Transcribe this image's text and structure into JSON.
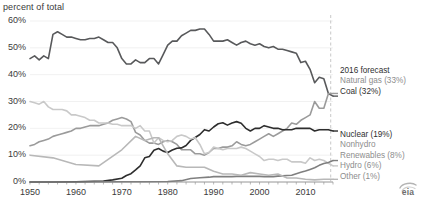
{
  "header": {
    "axis_note": "percent of total",
    "clipped_title": "U.S. electricity generation by source (1950-2016)"
  },
  "chart_data": {
    "type": "line",
    "title": "",
    "xlabel": "",
    "ylabel": "percent of total",
    "ylim": [
      0,
      60
    ],
    "xlim": [
      1950,
      2016
    ],
    "grid": true,
    "y_ticks": [
      "0%",
      "10%",
      "20%",
      "30%",
      "40%",
      "50%",
      "60%"
    ],
    "y_tick_values": [
      0,
      10,
      20,
      30,
      40,
      50,
      60
    ],
    "x_ticks": [
      "1950",
      "1960",
      "1970",
      "1980",
      "1990",
      "2000",
      "2010"
    ],
    "x_tick_values": [
      1950,
      1960,
      1970,
      1980,
      1990,
      2000,
      2010
    ],
    "legend_position": "right",
    "forecast_marker": {
      "label": "2016 forecast",
      "x": 2015.5,
      "style": "dashed-vertical"
    },
    "series": [
      {
        "name": "Coal",
        "legend": "Coal (32%)",
        "color": "#58595b",
        "final_value": 32,
        "x": [
          1950,
          1951,
          1952,
          1953,
          1954,
          1955,
          1956,
          1957,
          1958,
          1959,
          1960,
          1961,
          1962,
          1963,
          1964,
          1965,
          1966,
          1967,
          1968,
          1969,
          1970,
          1971,
          1972,
          1973,
          1974,
          1975,
          1976,
          1977,
          1978,
          1979,
          1980,
          1981,
          1982,
          1983,
          1984,
          1985,
          1986,
          1987,
          1988,
          1989,
          1990,
          1991,
          1992,
          1993,
          1994,
          1995,
          1996,
          1997,
          1998,
          1999,
          2000,
          2001,
          2002,
          2003,
          2004,
          2005,
          2006,
          2007,
          2008,
          2009,
          2010,
          2011,
          2012,
          2013,
          2014,
          2015,
          2016
        ],
        "values": [
          46,
          47,
          45.5,
          47,
          46,
          55,
          56,
          55,
          54,
          54,
          53.5,
          53,
          53,
          53.5,
          53.5,
          54,
          53,
          52,
          52,
          50,
          46,
          44,
          44,
          45.5,
          44.5,
          44.5,
          46,
          46,
          44,
          47.5,
          51,
          52.5,
          52.5,
          54.5,
          55.5,
          56.5,
          56.5,
          57,
          57,
          55,
          52.5,
          52.5,
          52.5,
          53,
          52,
          51,
          52,
          52.5,
          51.5,
          51,
          51.5,
          50.5,
          50,
          50.5,
          49.5,
          49.5,
          49,
          48.5,
          48,
          44.5,
          45,
          42,
          37,
          39,
          38.5,
          33,
          32
        ]
      },
      {
        "name": "Natural gas",
        "legend": "Natural gas (33%)",
        "color": "#9b9b9b",
        "final_value": 33,
        "x": [
          1950,
          1951,
          1952,
          1953,
          1954,
          1955,
          1956,
          1957,
          1958,
          1959,
          1960,
          1961,
          1962,
          1963,
          1964,
          1965,
          1966,
          1967,
          1968,
          1969,
          1970,
          1971,
          1972,
          1973,
          1974,
          1975,
          1976,
          1977,
          1978,
          1979,
          1980,
          1981,
          1982,
          1983,
          1984,
          1985,
          1986,
          1987,
          1988,
          1989,
          1990,
          1991,
          1992,
          1993,
          1994,
          1995,
          1996,
          1997,
          1998,
          1999,
          2000,
          2001,
          2002,
          2003,
          2004,
          2005,
          2006,
          2007,
          2008,
          2009,
          2010,
          2011,
          2012,
          2013,
          2014,
          2015,
          2016
        ],
        "values": [
          13.5,
          14,
          15,
          15.5,
          16,
          17,
          17.5,
          18,
          18.5,
          19,
          20,
          20,
          20.5,
          21,
          21,
          21,
          21.5,
          22,
          23,
          23.5,
          24,
          23.5,
          22.5,
          18.5,
          17.5,
          15.5,
          14.5,
          14.5,
          14,
          15,
          15.5,
          15,
          14,
          12,
          12,
          12,
          10.5,
          10.5,
          10,
          11,
          12.5,
          12.5,
          13,
          13,
          13.5,
          15,
          14,
          13.5,
          14,
          15,
          16,
          17,
          18,
          17,
          18,
          19,
          20,
          22,
          21.5,
          23,
          24,
          25,
          30,
          27.5,
          27.5,
          33,
          33
        ]
      },
      {
        "name": "Nuclear",
        "legend": "Nuclear (19%)",
        "color": "#2d2d2d",
        "final_value": 19,
        "x": [
          1950,
          1955,
          1960,
          1962,
          1964,
          1966,
          1968,
          1970,
          1971,
          1972,
          1973,
          1974,
          1975,
          1976,
          1977,
          1978,
          1979,
          1980,
          1981,
          1982,
          1983,
          1984,
          1985,
          1986,
          1987,
          1988,
          1989,
          1990,
          1991,
          1992,
          1993,
          1994,
          1995,
          1996,
          1997,
          1998,
          1999,
          2000,
          2001,
          2002,
          2003,
          2004,
          2005,
          2006,
          2007,
          2008,
          2009,
          2010,
          2011,
          2012,
          2013,
          2014,
          2015,
          2016
        ],
        "values": [
          0,
          0,
          0.1,
          0.2,
          0.3,
          0.4,
          0.8,
          1.4,
          2.4,
          3.1,
          4.5,
          6,
          9,
          9.5,
          11.8,
          12.5,
          11.5,
          11,
          11.9,
          12.6,
          12.7,
          13.6,
          15.5,
          16.6,
          17.7,
          19.5,
          19,
          20.5,
          21.7,
          22.1,
          21.2,
          22,
          22.5,
          21.9,
          20,
          19,
          20,
          20,
          21,
          20.5,
          20,
          20,
          19.5,
          19.5,
          19.5,
          20,
          20,
          20,
          20,
          19,
          19.5,
          19.5,
          19.5,
          19
        ]
      },
      {
        "name": "Hydro",
        "legend": "Hydro (6%)",
        "color": "#c9c9c9",
        "final_value": 6,
        "x": [
          1950,
          1951,
          1952,
          1953,
          1954,
          1955,
          1956,
          1957,
          1958,
          1959,
          1960,
          1961,
          1962,
          1963,
          1964,
          1965,
          1966,
          1967,
          1968,
          1969,
          1970,
          1971,
          1972,
          1973,
          1974,
          1975,
          1976,
          1977,
          1978,
          1979,
          1980,
          1981,
          1982,
          1983,
          1984,
          1985,
          1986,
          1987,
          1988,
          1989,
          1990,
          1991,
          1992,
          1993,
          1994,
          1995,
          1996,
          1997,
          1998,
          1999,
          2000,
          2001,
          2002,
          2003,
          2004,
          2005,
          2006,
          2007,
          2008,
          2009,
          2010,
          2011,
          2012,
          2013,
          2014,
          2015,
          2016
        ],
        "values": [
          30,
          29.5,
          29,
          30,
          28,
          27,
          27,
          27,
          26.5,
          25,
          25,
          24.5,
          24,
          23,
          23,
          22,
          22,
          22,
          21.5,
          21.5,
          21,
          21,
          21,
          20,
          21,
          19,
          19,
          14.5,
          16.5,
          15.5,
          15,
          15.5,
          17,
          17.5,
          17,
          16,
          16.5,
          14,
          10.5,
          11,
          13,
          12.5,
          12,
          12.5,
          12.5,
          12.5,
          13,
          12.5,
          11.5,
          10.5,
          9.5,
          8,
          8.5,
          8.5,
          8,
          8.5,
          8.5,
          7.5,
          7.5,
          7.5,
          7,
          9,
          8,
          8.5,
          8,
          7,
          6
        ]
      },
      {
        "name": "Nonhydro Renewables",
        "legend_line1": "Nonhydro",
        "legend_line2": "Renewables (8%)",
        "color": "#7f7f7f",
        "final_value": 8,
        "x": [
          1950,
          1960,
          1970,
          1975,
          1980,
          1983,
          1985,
          1987,
          1989,
          1990,
          1991,
          1992,
          1993,
          1994,
          1995,
          1996,
          1997,
          1998,
          1999,
          2000,
          2001,
          2002,
          2003,
          2004,
          2005,
          2006,
          2007,
          2008,
          2009,
          2010,
          2011,
          2012,
          2013,
          2014,
          2015,
          2016
        ],
        "values": [
          0,
          0,
          0.1,
          0.1,
          0.2,
          0.5,
          1.3,
          1.6,
          1.8,
          2,
          2,
          2,
          2,
          2,
          2.1,
          2.1,
          2.1,
          2.1,
          2.1,
          2.1,
          2,
          2,
          2,
          2.2,
          2.3,
          2.4,
          2.5,
          3.1,
          3.6,
          4.1,
          4.7,
          5.3,
          6.2,
          6.9,
          7.3,
          8
        ]
      },
      {
        "name": "Other",
        "legend": "Other (1%)",
        "color": "#b8b8b8",
        "final_value": 1,
        "x": [
          1950,
          1955,
          1960,
          1965,
          1970,
          1973,
          1975,
          1977,
          1978,
          1979,
          1980,
          1982,
          1984,
          1986,
          1988,
          1990,
          1992,
          1994,
          1996,
          1998,
          2000,
          2002,
          2004,
          2006,
          2008,
          2010,
          2012,
          2014,
          2016
        ],
        "values": [
          10,
          9,
          6.5,
          6,
          12,
          17,
          15.5,
          16.5,
          16.5,
          13.5,
          10.5,
          6,
          5.5,
          5.5,
          5.5,
          4,
          3,
          3,
          2.5,
          3.5,
          3,
          2.5,
          3,
          1.5,
          1.5,
          1,
          0.8,
          1,
          1
        ]
      }
    ]
  },
  "legend": {
    "top": {
      "forecast": "2016 forecast",
      "natural_gas": "Natural gas (33%)",
      "coal": "Coal (32%)"
    },
    "bottom": {
      "nuclear": "Nuclear (19%)",
      "nonhydro_line1": "Nonhydro",
      "nonhydro_line2": "Renewables (8%)",
      "hydro": "Hydro (6%)",
      "other": "Other (1%)"
    }
  },
  "branding": {
    "logo_text": "eia"
  }
}
